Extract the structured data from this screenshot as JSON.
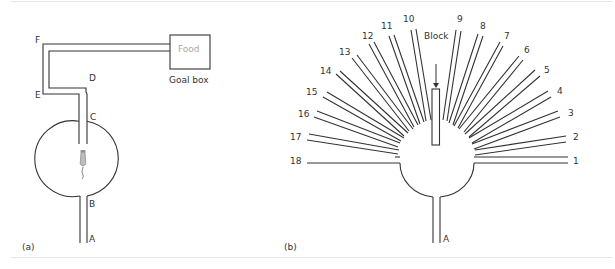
{
  "figure": {
    "panel_a": {
      "caption": "(a)",
      "labels": {
        "A": "A",
        "B": "B",
        "C": "C",
        "D": "D",
        "E": "E",
        "F": "F"
      },
      "goal_box": {
        "content": "Food",
        "label": "Goal box"
      }
    },
    "panel_b": {
      "caption": "(b)",
      "block_label": "Block",
      "stem_label": "A",
      "arms": [
        "1",
        "2",
        "3",
        "4",
        "5",
        "6",
        "7",
        "8",
        "9",
        "10",
        "11",
        "12",
        "13",
        "14",
        "15",
        "16",
        "17",
        "18"
      ]
    }
  },
  "colors": {
    "line": "#333333",
    "food_text": "#a8a8a8",
    "frame": "#e6e6e6",
    "background": "#ffffff"
  }
}
